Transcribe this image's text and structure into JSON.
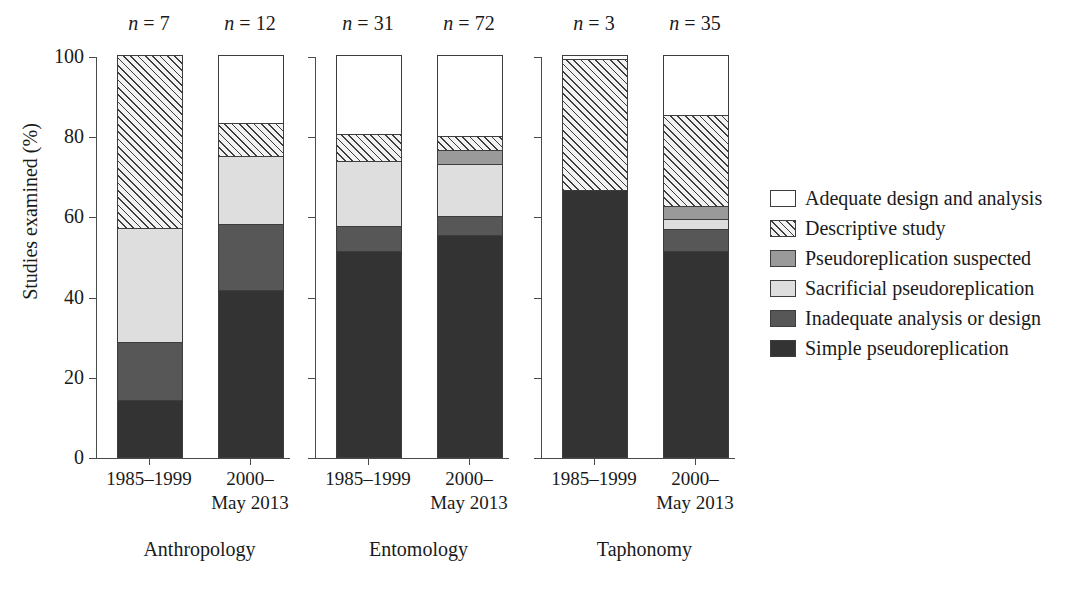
{
  "chart_data": {
    "type": "bar",
    "subtype": "stacked-100-percent",
    "title": "",
    "xlabel": "",
    "ylabel": "Studies examined (%)",
    "ylim": [
      0,
      100
    ],
    "yticks": [
      0,
      20,
      40,
      60,
      80,
      100
    ],
    "ytick_labels": [
      "0",
      "20",
      "40",
      "60",
      "80",
      "100"
    ],
    "grid": false,
    "legend_position": "right",
    "stack_order_bottom_to_top": [
      "Simple pseudoreplication",
      "Inadequate analysis or design",
      "Sacrificial pseudoreplication",
      "Pseudoreplication suspected",
      "Descriptive study",
      "Adequate design and analysis"
    ],
    "series": [
      {
        "name": "Adequate design and analysis",
        "fill": "white",
        "values": [
          0.0,
          16.7,
          19.4,
          19.9,
          0.7,
          14.8
        ]
      },
      {
        "name": "Descriptive study",
        "fill": "hatch",
        "values": [
          42.7,
          8.3,
          6.8,
          3.5,
          32.6,
          22.6
        ]
      },
      {
        "name": "Pseudoreplication suspected",
        "fill": "midgray",
        "values": [
          0.0,
          0.0,
          0.0,
          3.5,
          0.0,
          3.2
        ]
      },
      {
        "name": "Sacrificial pseudoreplication",
        "fill": "lightgray",
        "values": [
          28.6,
          16.9,
          16.1,
          13.0,
          0.0,
          2.5
        ]
      },
      {
        "name": "Inadequate analysis or design",
        "fill": "darkgray",
        "values": [
          14.3,
          16.4,
          6.4,
          4.8,
          0.0,
          5.5
        ]
      },
      {
        "name": "Simple pseudoreplication",
        "fill": "black",
        "values": [
          14.3,
          41.7,
          51.3,
          55.3,
          66.7,
          51.4
        ]
      }
    ],
    "groups": [
      {
        "name": "Anthropology",
        "bars": [
          {
            "period": "1985–1999",
            "n_label": "n = 7",
            "n": 7,
            "segments_bottom_to_top": [
              {
                "category": "Simple pseudoreplication",
                "value": 14.3
              },
              {
                "category": "Inadequate analysis or design",
                "value": 14.3
              },
              {
                "category": "Sacrificial pseudoreplication",
                "value": 28.6
              },
              {
                "category": "Pseudoreplication suspected",
                "value": 0.0
              },
              {
                "category": "Descriptive study",
                "value": 42.7
              },
              {
                "category": "Adequate design and analysis",
                "value": 0.0
              }
            ]
          },
          {
            "period": "2000–\nMay 2013",
            "n_label": "n = 12",
            "n": 12,
            "segments_bottom_to_top": [
              {
                "category": "Simple pseudoreplication",
                "value": 41.7
              },
              {
                "category": "Inadequate analysis or design",
                "value": 16.4
              },
              {
                "category": "Sacrificial pseudoreplication",
                "value": 16.9
              },
              {
                "category": "Pseudoreplication suspected",
                "value": 0.0
              },
              {
                "category": "Descriptive study",
                "value": 8.3
              },
              {
                "category": "Adequate design and analysis",
                "value": 16.7
              }
            ]
          }
        ]
      },
      {
        "name": "Entomology",
        "bars": [
          {
            "period": "1985–1999",
            "n_label": "n = 31",
            "n": 31,
            "segments_bottom_to_top": [
              {
                "category": "Simple pseudoreplication",
                "value": 51.3
              },
              {
                "category": "Inadequate analysis or design",
                "value": 6.4
              },
              {
                "category": "Sacrificial pseudoreplication",
                "value": 16.1
              },
              {
                "category": "Pseudoreplication suspected",
                "value": 0.0
              },
              {
                "category": "Descriptive study",
                "value": 6.8
              },
              {
                "category": "Adequate design and analysis",
                "value": 19.4
              }
            ]
          },
          {
            "period": "2000–\nMay 2013",
            "n_label": "n = 72",
            "n": 72,
            "segments_bottom_to_top": [
              {
                "category": "Simple pseudoreplication",
                "value": 55.3
              },
              {
                "category": "Inadequate analysis or design",
                "value": 4.8
              },
              {
                "category": "Sacrificial pseudoreplication",
                "value": 13.0
              },
              {
                "category": "Pseudoreplication suspected",
                "value": 3.5
              },
              {
                "category": "Descriptive study",
                "value": 3.5
              },
              {
                "category": "Adequate design and analysis",
                "value": 19.9
              }
            ]
          }
        ]
      },
      {
        "name": "Taphonomy",
        "bars": [
          {
            "period": "1985–1999",
            "n_label": "n = 3",
            "n": 3,
            "segments_bottom_to_top": [
              {
                "category": "Simple pseudoreplication",
                "value": 66.7
              },
              {
                "category": "Inadequate analysis or design",
                "value": 0.0
              },
              {
                "category": "Sacrificial pseudoreplication",
                "value": 0.0
              },
              {
                "category": "Pseudoreplication suspected",
                "value": 0.0
              },
              {
                "category": "Descriptive study",
                "value": 32.6
              },
              {
                "category": "Adequate design and analysis",
                "value": 0.7
              }
            ]
          },
          {
            "period": "2000–\nMay 2013",
            "n_label": "n = 35",
            "n": 35,
            "segments_bottom_to_top": [
              {
                "category": "Simple pseudoreplication",
                "value": 51.4
              },
              {
                "category": "Inadequate analysis or design",
                "value": 5.5
              },
              {
                "category": "Sacrificial pseudoreplication",
                "value": 2.5
              },
              {
                "category": "Pseudoreplication suspected",
                "value": 3.2
              },
              {
                "category": "Descriptive study",
                "value": 22.6
              },
              {
                "category": "Adequate design and analysis",
                "value": 14.8
              }
            ]
          }
        ]
      }
    ]
  },
  "axis": {
    "ylabel": "Studies examined (%)",
    "ytick_labels": [
      "100",
      "80",
      "60",
      "40",
      "20",
      "0"
    ]
  },
  "legend": {
    "items": [
      {
        "label": "Adequate design and analysis",
        "fill": "white"
      },
      {
        "label": "Descriptive study",
        "fill": "hatch"
      },
      {
        "label": "Pseudoreplication suspected",
        "fill": "midgray"
      },
      {
        "label": "Sacrificial pseudoreplication",
        "fill": "lightgray"
      },
      {
        "label": "Inadequate analysis or design",
        "fill": "darkgray"
      },
      {
        "label": "Simple pseudoreplication",
        "fill": "black"
      }
    ]
  },
  "colors": {
    "white": "#ffffff",
    "lightgray": "#dedede",
    "midgray": "#9a9a9a",
    "darkgray": "#575757",
    "black": "#333333",
    "outline": "#3d3d3d",
    "axis": "#4a4a4a"
  }
}
